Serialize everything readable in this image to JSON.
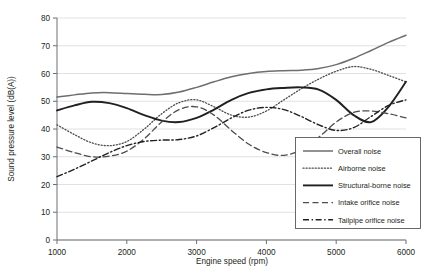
{
  "chart_data": {
    "type": "line",
    "title": "",
    "xlabel": "Engine speed (rpm)",
    "ylabel": "Sound pressure level (dB(A))",
    "xlim": [
      1000,
      6000
    ],
    "ylim": [
      0,
      80
    ],
    "xticks": [
      1000,
      2000,
      3000,
      4000,
      5000,
      6000
    ],
    "yticks": [
      0,
      10,
      20,
      30,
      40,
      50,
      60,
      70,
      80
    ],
    "grid": "horizontal",
    "legend_position": "lower-right-inside",
    "x": [
      1000,
      1250,
      1500,
      1750,
      2000,
      2250,
      2500,
      2750,
      3000,
      3250,
      3500,
      3750,
      4000,
      4250,
      4500,
      4750,
      5000,
      5250,
      5500,
      5750,
      6000
    ],
    "series": [
      {
        "name": "Overall noise",
        "style": "solid",
        "color": "#6d6e71",
        "width": 1.5,
        "values": [
          51.5,
          52.3,
          53.0,
          53.1,
          52.8,
          52.5,
          52.4,
          53.3,
          55.0,
          57.0,
          58.8,
          60.0,
          60.7,
          61.0,
          61.2,
          61.8,
          63.2,
          65.5,
          68.3,
          71.2,
          73.8
        ]
      },
      {
        "name": "Airborne noise",
        "style": "dotted",
        "color": "#4d4d4f",
        "width": 1.3,
        "values": [
          41.5,
          38.0,
          35.0,
          34.0,
          35.5,
          40.0,
          45.5,
          49.5,
          50.5,
          48.0,
          45.0,
          44.3,
          46.5,
          50.5,
          54.5,
          58.0,
          60.8,
          62.5,
          61.5,
          59.3,
          57.0
        ]
      },
      {
        "name": "Structural-borne noise",
        "style": "solid",
        "color": "#231f20",
        "width": 1.9,
        "values": [
          46.7,
          48.5,
          49.8,
          49.3,
          47.5,
          45.0,
          43.0,
          42.5,
          44.0,
          47.0,
          50.5,
          53.0,
          54.3,
          54.8,
          55.0,
          54.2,
          50.5,
          45.0,
          42.5,
          48.0,
          57.0
        ]
      },
      {
        "name": "Intake orifice noise",
        "style": "dashed",
        "color": "#4d4d4f",
        "width": 1.3,
        "values": [
          33.5,
          31.5,
          30.0,
          30.2,
          32.0,
          36.5,
          42.5,
          47.0,
          48.0,
          45.0,
          39.5,
          34.5,
          31.5,
          30.5,
          32.5,
          37.0,
          42.5,
          46.0,
          46.5,
          45.5,
          44.0
        ]
      },
      {
        "name": "Tailpipe orifice noise",
        "style": "dash-dot",
        "color": "#231f20",
        "width": 1.4,
        "values": [
          22.8,
          25.5,
          28.5,
          31.5,
          34.0,
          35.5,
          36.0,
          36.2,
          37.5,
          40.5,
          44.0,
          46.8,
          47.8,
          47.0,
          44.5,
          41.5,
          39.5,
          40.5,
          44.5,
          48.5,
          50.5
        ]
      }
    ]
  },
  "legend": {
    "items": [
      {
        "label": "Overall noise"
      },
      {
        "label": "Airborne noise"
      },
      {
        "label": "Structural-borne noise"
      },
      {
        "label": "Intake orifice noise"
      },
      {
        "label": "Tailpipe orifice noise"
      }
    ]
  },
  "axes": {
    "x_title": "Engine speed (rpm)",
    "y_title": "Sound pressure level (dB(A))",
    "x_tick_labels": [
      "1000",
      "2000",
      "3000",
      "4000",
      "5000",
      "6000"
    ],
    "y_tick_labels": [
      "0",
      "10",
      "20",
      "30",
      "40",
      "50",
      "60",
      "70",
      "80"
    ]
  }
}
